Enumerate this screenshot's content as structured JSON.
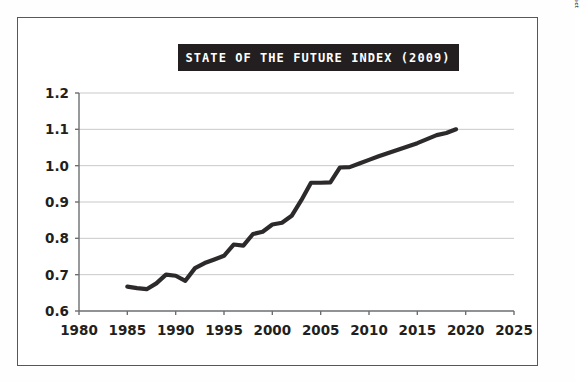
{
  "figure": {
    "title": "STATE OF THE FUTURE INDEX (2009)",
    "source_credit": "Source: The Millennium Project",
    "frame_color": "#58585a",
    "background_color": "#ffffff",
    "title_banner_color": "#231f20",
    "title_text_color": "#ffffff",
    "line_color": "#2d2a2b",
    "gridline_color": "#c9c9c9",
    "axis_color": "#6d6e70"
  },
  "chart_data": {
    "type": "line",
    "title": "STATE OF THE FUTURE INDEX (2009)",
    "xlabel": "",
    "ylabel": "",
    "xlim": [
      1980,
      2025
    ],
    "ylim": [
      0.6,
      1.2
    ],
    "grid": "horizontal",
    "legend": "none",
    "xticks": [
      1980,
      1985,
      1990,
      1995,
      2000,
      2005,
      2010,
      2015,
      2020,
      2025
    ],
    "xtick_labels": [
      "1980",
      "1985",
      "1990",
      "1995",
      "2000",
      "2005",
      "2010",
      "2015",
      "2020",
      "2025"
    ],
    "yticks": [
      0.6,
      0.7,
      0.8,
      0.9,
      1.0,
      1.1,
      1.2
    ],
    "ytick_labels": [
      "0.6",
      "0.7",
      "0.8",
      "0.9",
      "1.0",
      "1.1",
      "1.2"
    ],
    "series": [
      {
        "name": "State of the Future Index",
        "x": [
          1985,
          1986,
          1987,
          1988,
          1989,
          1990,
          1991,
          1992,
          1993,
          1994,
          1995,
          1996,
          1997,
          1998,
          1999,
          2000,
          2001,
          2002,
          2003,
          2004,
          2005,
          2006,
          2007,
          2008,
          2009,
          2010,
          2011,
          2012,
          2013,
          2014,
          2015,
          2016,
          2017,
          2018,
          2019
        ],
        "values": [
          0.667,
          0.663,
          0.66,
          0.676,
          0.7,
          0.697,
          0.683,
          0.718,
          0.732,
          0.742,
          0.752,
          0.783,
          0.78,
          0.812,
          0.818,
          0.838,
          0.843,
          0.862,
          0.905,
          0.953,
          0.953,
          0.954,
          0.995,
          0.996,
          1.006,
          1.016,
          1.026,
          1.035,
          1.044,
          1.053,
          1.062,
          1.073,
          1.084,
          1.09,
          1.1
        ]
      }
    ]
  }
}
